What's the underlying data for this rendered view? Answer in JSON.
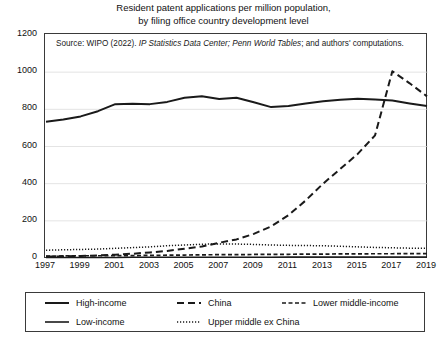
{
  "title": {
    "line1": "Resident patent applications per million population,",
    "line2": "by filing office country development level"
  },
  "source_note": {
    "prefix": "Source: WIPO (2022). ",
    "italic1": "IP Statistics Data Center; Penn World Tables",
    "suffix": "; and authors' computations."
  },
  "legend": {
    "items": [
      {
        "label": "High-income",
        "style": "solid-thick",
        "color": "#1a1a1a"
      },
      {
        "label": "China",
        "style": "dash-long",
        "color": "#1a1a1a"
      },
      {
        "label": "Lower middle-income",
        "style": "dash-short",
        "color": "#1a1a1a"
      },
      {
        "label": "Low-income",
        "style": "solid-thin",
        "color": "#1a1a1a"
      },
      {
        "label": "Upper middle ex China",
        "style": "dotted",
        "color": "#1a1a1a"
      }
    ]
  },
  "chart_data": {
    "type": "line",
    "title": "Resident patent applications per million population, by filing office country development level",
    "xlabel": "",
    "ylabel": "",
    "xlim": [
      1997,
      2019
    ],
    "ylim": [
      0,
      1200
    ],
    "yticks": [
      0,
      200,
      400,
      600,
      800,
      1000,
      1200
    ],
    "xticks": [
      1997,
      1999,
      2001,
      2003,
      2005,
      2007,
      2009,
      2011,
      2013,
      2015,
      2017,
      2019
    ],
    "grid": true,
    "legend_position": "bottom",
    "x": [
      1997,
      1998,
      1999,
      2000,
      2001,
      2002,
      2003,
      2004,
      2005,
      2006,
      2007,
      2008,
      2009,
      2010,
      2011,
      2012,
      2013,
      2014,
      2015,
      2016,
      2017,
      2018,
      2019
    ],
    "series": [
      {
        "name": "High-income",
        "style": "solid-thick",
        "values": [
          733,
          745,
          762,
          790,
          828,
          830,
          828,
          840,
          862,
          870,
          855,
          862,
          838,
          812,
          818,
          832,
          843,
          852,
          857,
          853,
          848,
          832,
          818
        ]
      },
      {
        "name": "China",
        "style": "dash-long",
        "values": [
          8,
          9,
          11,
          14,
          18,
          23,
          30,
          38,
          50,
          62,
          82,
          100,
          130,
          170,
          230,
          310,
          400,
          480,
          560,
          660,
          1005,
          940,
          870
        ]
      },
      {
        "name": "Lower middle-income",
        "style": "dash-short",
        "values": [
          10,
          11,
          12,
          12,
          13,
          13,
          14,
          15,
          16,
          17,
          18,
          18,
          19,
          20,
          20,
          21,
          21,
          22,
          22,
          23,
          23,
          24,
          24
        ]
      },
      {
        "name": "Low-income",
        "style": "solid-thin",
        "values": [
          3,
          3,
          3,
          3,
          3,
          4,
          4,
          4,
          4,
          4,
          4,
          4,
          4,
          4,
          5,
          5,
          5,
          5,
          5,
          5,
          5,
          5,
          5
        ]
      },
      {
        "name": "Upper middle ex China",
        "style": "dotted",
        "values": [
          42,
          44,
          46,
          48,
          52,
          56,
          60,
          66,
          70,
          74,
          76,
          75,
          73,
          70,
          68,
          67,
          66,
          63,
          60,
          57,
          55,
          53,
          52
        ]
      }
    ]
  }
}
